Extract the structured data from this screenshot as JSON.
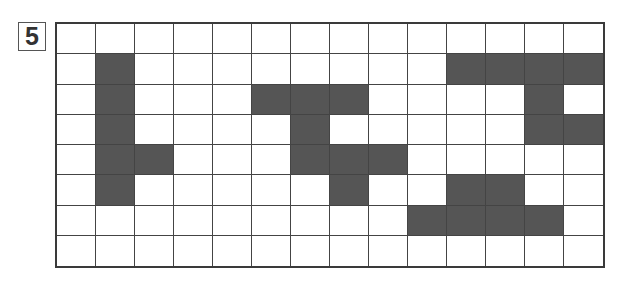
{
  "label": "5",
  "colors": {
    "filled": "#555555",
    "empty": "#ffffff",
    "line": "#444444"
  },
  "grid": {
    "rows": 8,
    "cols": 14,
    "filled_cells": [
      [
        1,
        1
      ],
      [
        2,
        1
      ],
      [
        3,
        1
      ],
      [
        4,
        1
      ],
      [
        5,
        1
      ],
      [
        4,
        2
      ],
      [
        2,
        5
      ],
      [
        2,
        6
      ],
      [
        2,
        7
      ],
      [
        3,
        6
      ],
      [
        4,
        6
      ],
      [
        4,
        7
      ],
      [
        4,
        8
      ],
      [
        5,
        7
      ],
      [
        1,
        10
      ],
      [
        1,
        11
      ],
      [
        1,
        12
      ],
      [
        1,
        13
      ],
      [
        2,
        12
      ],
      [
        3,
        12
      ],
      [
        3,
        13
      ],
      [
        5,
        10
      ],
      [
        5,
        11
      ],
      [
        6,
        9
      ],
      [
        6,
        10
      ],
      [
        6,
        11
      ],
      [
        6,
        12
      ]
    ]
  }
}
